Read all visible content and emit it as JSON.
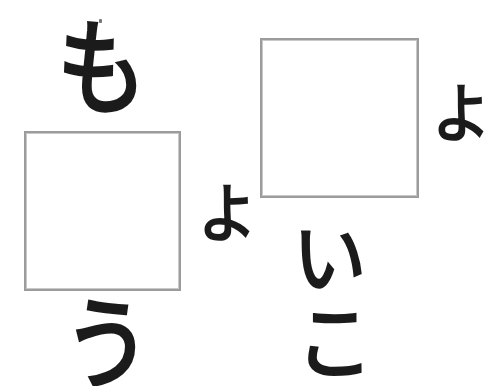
{
  "document": {
    "kind": "scanned-hiragana-worksheet",
    "background_color": "#ffffff",
    "ink_color": "#1b1b1b",
    "box_border_color": "#9c9c9c",
    "width_px": 490,
    "height_px": 386
  },
  "glyphs": {
    "mo": "も",
    "yo_left": "よ",
    "yo_right": "よ",
    "u": "う",
    "i": "い",
    "ko": "こ"
  },
  "boxes": {
    "left": {
      "label": "",
      "x": 24,
      "y": 131,
      "width": 157,
      "height": 160
    },
    "right": {
      "label": "",
      "x": 260,
      "y": 38,
      "width": 159,
      "height": 160
    }
  }
}
